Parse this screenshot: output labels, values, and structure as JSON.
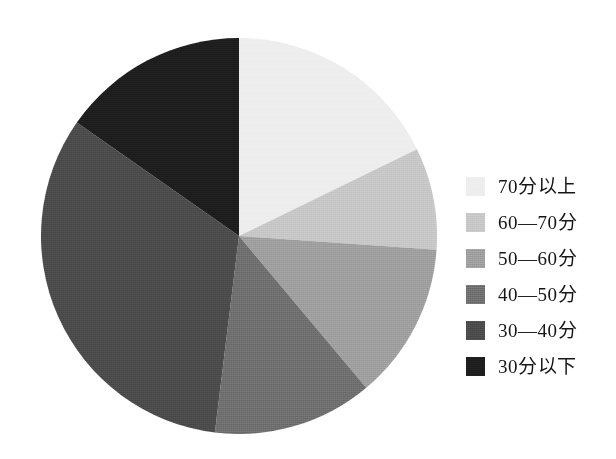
{
  "chart_data": {
    "type": "pie",
    "title": "",
    "subtitle": "",
    "xlabel": "",
    "ylabel": "",
    "legend_position": "right",
    "grid": false,
    "start_angle_deg": 0,
    "direction": "clockwise",
    "categories": [
      "70分以上",
      "60—70分",
      "50—60分",
      "40—50分",
      "30—40分",
      "30分以下"
    ],
    "values": [
      17.8,
      8.3,
      12.8,
      13.1,
      32.8,
      15.2
    ],
    "units": "percent",
    "slices": [
      {
        "label": "70分以上",
        "value": 17.8,
        "color": "#ededed",
        "start_deg": 0,
        "end_deg": 64
      },
      {
        "label": "60—70分",
        "value": 8.3,
        "color": "#c6c6c6",
        "start_deg": 64,
        "end_deg": 94
      },
      {
        "label": "50—60分",
        "value": 12.8,
        "color": "#9d9d9d",
        "start_deg": 94,
        "end_deg": 140
      },
      {
        "label": "40—50分",
        "value": 13.1,
        "color": "#6d6d6d",
        "start_deg": 140,
        "end_deg": 187
      },
      {
        "label": "30—40分",
        "value": 32.8,
        "color": "#4a4a4a",
        "start_deg": 187,
        "end_deg": 305
      },
      {
        "label": "30分以下",
        "value": 15.2,
        "color": "#1d1d1d",
        "start_deg": 305,
        "end_deg": 360
      }
    ]
  },
  "legend": {
    "items": [
      {
        "label": "70分以上",
        "color": "#ededed"
      },
      {
        "label": "60—70分",
        "color": "#c6c6c6"
      },
      {
        "label": "50—60分",
        "color": "#9d9d9d"
      },
      {
        "label": "40—50分",
        "color": "#6d6d6d"
      },
      {
        "label": "30—40分",
        "color": "#4a4a4a"
      },
      {
        "label": "30分以下",
        "color": "#1d1d1d"
      }
    ]
  },
  "colors": {
    "background": "#ffffff",
    "text": "#151515"
  }
}
